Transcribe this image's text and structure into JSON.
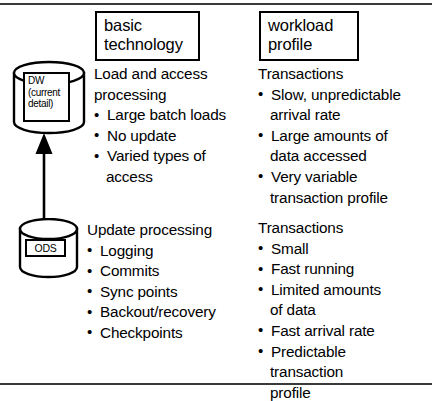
{
  "diagram": {
    "frame_color": "#3a3a3a",
    "line_color": "#000000",
    "background": "#ffffff"
  },
  "headers": {
    "basic_technology": {
      "line1": "basic",
      "line2": "technology"
    },
    "workload_profile": {
      "line1": "workload",
      "line2": "profile"
    }
  },
  "entities": {
    "dw": {
      "icon": "database-cylinder-icon",
      "label_line1": "DW",
      "label_line2": "(current",
      "label_line3": "detail)"
    },
    "ods": {
      "icon": "database-cylinder-icon",
      "label": "ODS"
    },
    "arrow": {
      "icon": "up-arrow-icon",
      "direction": "up",
      "from": "ODS",
      "to": "DW"
    }
  },
  "columns": {
    "dw_technology": {
      "heading_line1": "Load and access",
      "heading_line2": "processing",
      "items": [
        {
          "text": "Large batch loads"
        },
        {
          "text": "No update"
        },
        {
          "text": "Varied types of",
          "cont": "access"
        }
      ]
    },
    "dw_workload": {
      "heading_line1": "Transactions",
      "items": [
        {
          "text": "Slow, unpredictable",
          "cont": "arrival rate"
        },
        {
          "text": "Large amounts of",
          "cont": "data accessed"
        },
        {
          "text": "Very variable",
          "cont": "transaction profile"
        }
      ]
    },
    "ods_technology": {
      "heading_line1": "Update processing",
      "items": [
        {
          "text": "Logging"
        },
        {
          "text": "Commits"
        },
        {
          "text": "Sync points"
        },
        {
          "text": "Backout/recovery"
        },
        {
          "text": "Checkpoints"
        }
      ]
    },
    "ods_workload": {
      "heading_line1": "Transactions",
      "items": [
        {
          "text": "Small"
        },
        {
          "text": "Fast running"
        },
        {
          "text": "Limited amounts",
          "cont": "of data"
        },
        {
          "text": "Fast arrival rate"
        },
        {
          "text": "Predictable",
          "cont": "transaction",
          "cont2": "profile"
        }
      ]
    }
  },
  "bullet_glyph": "•"
}
